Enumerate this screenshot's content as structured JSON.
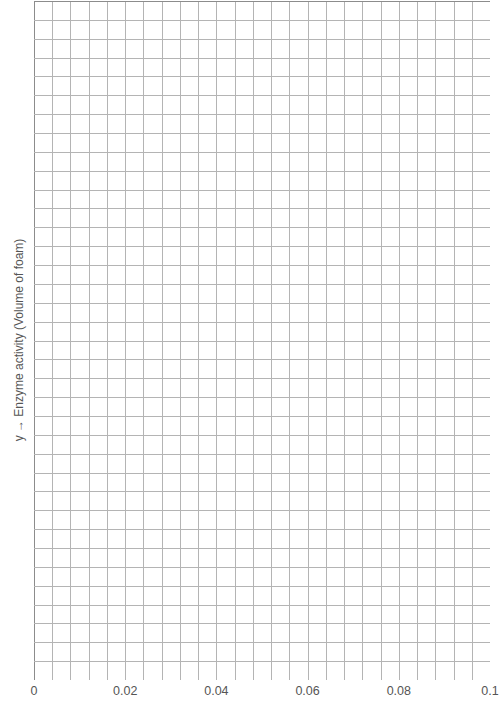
{
  "chart_data": {
    "type": "scatter",
    "title": "",
    "xlabel": "",
    "ylabel": "y → Enzyme activity (Volume of foam)",
    "x_ticks": [
      "0",
      "0.02",
      "0.04",
      "0.06",
      "0.08",
      "0.1"
    ],
    "x_tick_values": [
      0,
      0.02,
      0.04,
      0.06,
      0.08,
      0.1
    ],
    "xlim": [
      0,
      0.1
    ],
    "y_ticks": [],
    "grid": true,
    "grid_columns": 25,
    "grid_rows": 36,
    "series": [],
    "legend": null,
    "note": "Blank graph-paper grid with no plotted data"
  },
  "colors": {
    "grid_line": "#b4b4b4",
    "axis_line": "#8c8c8c",
    "text": "#555555",
    "background": "#ffffff"
  }
}
